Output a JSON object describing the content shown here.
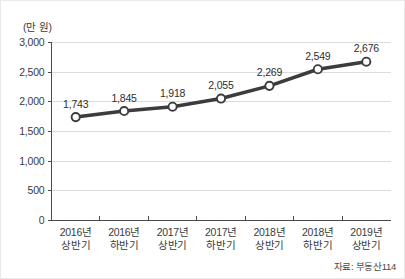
{
  "chart_data": {
    "type": "line",
    "title": "",
    "subtitle": "",
    "xlabel": "",
    "ylabel": "(만 원)",
    "unit_label": "(만 원)",
    "categories": [
      "2016년\n상반기",
      "2016년\n하반기",
      "2017년\n상반기",
      "2017년\n하반기",
      "2018년\n상반기",
      "2018년\n하반기",
      "2019년\n상반기"
    ],
    "category_lines": [
      [
        "2016년",
        "상반기"
      ],
      [
        "2016년",
        "하반기"
      ],
      [
        "2017년",
        "상반기"
      ],
      [
        "2017년",
        "하반기"
      ],
      [
        "2018년",
        "상반기"
      ],
      [
        "2018년",
        "하반기"
      ],
      [
        "2019년",
        "상반기"
      ]
    ],
    "values": [
      1743,
      1845,
      1918,
      2055,
      2269,
      2549,
      2676
    ],
    "value_labels": [
      "1,743",
      "1,845",
      "1,918",
      "2,055",
      "2,269",
      "2,549",
      "2,676"
    ],
    "ylim": [
      0,
      3000
    ],
    "yticks": [
      0,
      500,
      1000,
      1500,
      2000,
      2500,
      3000
    ],
    "ytick_labels": [
      "0",
      "500",
      "1,000",
      "1,500",
      "2,000",
      "2,500",
      "3,000"
    ],
    "grid": true,
    "legend": false,
    "legend_position": "none",
    "series": [
      {
        "name": "평균 분양가",
        "values": [
          1743,
          1845,
          1918,
          2055,
          2269,
          2549,
          2676
        ],
        "line_color": "#3c3c3c",
        "marker_fill": "#ffffff",
        "marker_stroke": "#3c3c3c"
      }
    ],
    "colors": {
      "line": "#3c3c3c",
      "marker_fill": "#ffffff",
      "grid": "#dcdcdc",
      "axis": "#4a4a4a",
      "text": "#3a3a3a",
      "background": "#ffffff"
    }
  },
  "source": {
    "note": "자료: 부동산114"
  }
}
